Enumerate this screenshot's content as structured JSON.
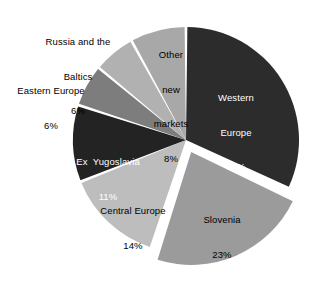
{
  "chart_data": {
    "type": "pie",
    "title": "",
    "subtitle": "",
    "xlabel": "",
    "ylabel": "",
    "grid": false,
    "legend_position": "none",
    "labels_format": "name + percent",
    "total_percent": 100,
    "categories": [
      "Western Europe",
      "Slovenia",
      "Central Europe",
      "Ex Yugoslavia",
      "Eastern Europe",
      "Russia and the Baltics",
      "Other new markets"
    ],
    "values": [
      32,
      23,
      14,
      11,
      6,
      6,
      8
    ],
    "slices": [
      {
        "name": "Western Europe",
        "name_line1": "Western",
        "name_line2": "Europe",
        "percent_text": "32%",
        "value": 32,
        "color": "#2c2c2c",
        "label_color": "#ffffff",
        "label_placement": "inside",
        "exploded": false
      },
      {
        "name": "Slovenia",
        "name_line1": "Slovenia",
        "name_line2": "",
        "percent_text": "23%",
        "value": 23,
        "color": "#9b9b9b",
        "label_color": "#000000",
        "label_placement": "inside",
        "exploded": true
      },
      {
        "name": "Central Europe",
        "name_line1": "Central Europe",
        "name_line2": "",
        "percent_text": "14%",
        "value": 14,
        "color": "#bdbdbd",
        "label_color": "#000000",
        "label_placement": "inside",
        "exploded": false
      },
      {
        "name": "Ex Yugoslavia",
        "name_line1": "Ex  Yugoslavia",
        "name_line2": "",
        "percent_text": "11%",
        "value": 11,
        "color": "#232323",
        "label_color": "#ffffff",
        "label_placement": "inside",
        "exploded": false
      },
      {
        "name": "Eastern Europe",
        "name_line1": "Eastern Europe",
        "name_line2": "",
        "percent_text": "6%",
        "value": 6,
        "color": "#7d7d7d",
        "label_color": "#000000",
        "label_placement": "outside",
        "exploded": false
      },
      {
        "name": "Russia and the Baltics",
        "name_line1": "Russia and the",
        "name_line2": "Baltics",
        "percent_text": "6%",
        "value": 6,
        "color": "#b1b1b1",
        "label_color": "#000000",
        "label_placement": "outside",
        "exploded": false
      },
      {
        "name": "Other new markets",
        "name_line1": "Other",
        "name_line2": "new",
        "name_line3": "markets",
        "percent_text": "8%",
        "value": 8,
        "color": "#a8a8a8",
        "label_color": "#000000",
        "label_placement": "inside",
        "exploded": false
      }
    ],
    "background_color": "#ffffff",
    "separator_color": "#ffffff"
  }
}
